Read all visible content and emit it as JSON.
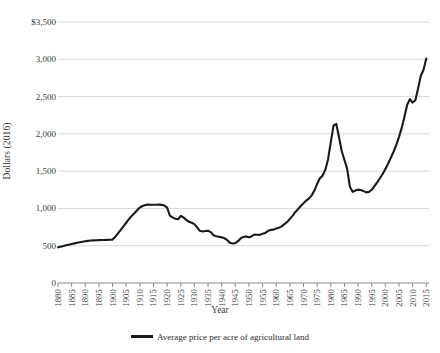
{
  "chart_data": {
    "type": "line",
    "title": "",
    "subtitle": "",
    "xlabel": "Year",
    "ylabel": "Dollars (2016)",
    "xlim": [
      1880,
      2016
    ],
    "ylim": [
      0,
      3500
    ],
    "grid": true,
    "legend_position": "bottom",
    "y_ticks": [
      0,
      500,
      1000,
      1500,
      2000,
      2500,
      3000,
      3500
    ],
    "y_tick_labels": [
      "0",
      "500",
      "1,000",
      "1,500",
      "2,000",
      "2,500",
      "3,000",
      "$3,500"
    ],
    "x_ticks": [
      1880,
      1885,
      1890,
      1895,
      1900,
      1905,
      1910,
      1915,
      1920,
      1925,
      1930,
      1935,
      1940,
      1945,
      1950,
      1955,
      1960,
      1965,
      1970,
      1975,
      1980,
      1985,
      1990,
      1995,
      2000,
      2005,
      2010,
      2015
    ],
    "x_tick_labels": [
      "1880",
      "1885",
      "1890",
      "1895",
      "1900",
      "1905",
      "1910",
      "1915",
      "1920",
      "1925",
      "1930",
      "1935",
      "1940",
      "1945",
      "1950",
      "1955",
      "1960",
      "1965",
      "1970",
      "1975",
      "1980",
      "1985",
      "1990",
      "1995",
      "2000",
      "2005",
      "2010",
      "2015"
    ],
    "line_color": "#1a1a1a",
    "grid_color": "#d9d9d9",
    "series": [
      {
        "name": "Average price per acre of agricultural land",
        "color": "#1a1a1a",
        "x": [
          1880,
          1881,
          1882,
          1883,
          1884,
          1885,
          1886,
          1887,
          1888,
          1889,
          1890,
          1891,
          1892,
          1893,
          1894,
          1895,
          1896,
          1897,
          1898,
          1899,
          1900,
          1901,
          1902,
          1903,
          1904,
          1905,
          1906,
          1907,
          1908,
          1909,
          1910,
          1911,
          1912,
          1913,
          1914,
          1915,
          1916,
          1917,
          1918,
          1919,
          1920,
          1921,
          1922,
          1923,
          1924,
          1925,
          1926,
          1927,
          1928,
          1929,
          1930,
          1931,
          1932,
          1933,
          1934,
          1935,
          1936,
          1937,
          1938,
          1939,
          1940,
          1941,
          1942,
          1943,
          1944,
          1945,
          1946,
          1947,
          1948,
          1949,
          1950,
          1951,
          1952,
          1953,
          1954,
          1955,
          1956,
          1957,
          1958,
          1959,
          1960,
          1961,
          1962,
          1963,
          1964,
          1965,
          1966,
          1967,
          1968,
          1969,
          1970,
          1971,
          1972,
          1973,
          1974,
          1975,
          1976,
          1977,
          1978,
          1979,
          1980,
          1981,
          1982,
          1983,
          1984,
          1985,
          1986,
          1987,
          1988,
          1989,
          1990,
          1991,
          1992,
          1993,
          1994,
          1995,
          1996,
          1997,
          1998,
          1999,
          2000,
          2001,
          2002,
          2003,
          2004,
          2005,
          2006,
          2007,
          2008,
          2009,
          2010,
          2011,
          2012,
          2013,
          2014,
          2015
        ],
        "values": [
          478,
          487,
          496,
          505,
          514,
          523,
          531,
          539,
          546,
          553,
          560,
          565,
          569,
          572,
          574,
          575,
          576,
          577,
          578,
          579,
          582,
          620,
          665,
          712,
          760,
          808,
          856,
          900,
          935,
          975,
          1012,
          1032,
          1046,
          1051,
          1050,
          1049,
          1050,
          1052,
          1048,
          1040,
          1010,
          905,
          880,
          862,
          855,
          900,
          880,
          845,
          820,
          808,
          790,
          745,
          700,
          690,
          697,
          700,
          682,
          640,
          628,
          620,
          612,
          600,
          578,
          540,
          530,
          535,
          560,
          600,
          618,
          625,
          612,
          628,
          650,
          648,
          645,
          660,
          672,
          700,
          712,
          716,
          730,
          742,
          760,
          790,
          818,
          860,
          900,
          952,
          990,
          1032,
          1070,
          1105,
          1135,
          1175,
          1240,
          1330,
          1405,
          1440,
          1520,
          1660,
          1890,
          2110,
          2135,
          1960,
          1770,
          1650,
          1530,
          1290,
          1222,
          1240,
          1252,
          1248,
          1232,
          1215,
          1222,
          1250,
          1300,
          1350,
          1405,
          1462,
          1530,
          1600,
          1680,
          1760,
          1850,
          1960,
          2080,
          2230,
          2390,
          2465,
          2420,
          2450,
          2610,
          2780,
          2860,
          3010
        ],
        "annotations": [
          {
            "label": "pre-1900 plateau",
            "x": 1895,
            "y": 575
          },
          {
            "label": "1910s farm boom peak",
            "x": 1913,
            "y": 1051
          },
          {
            "label": "Great Depression trough",
            "x": 1942,
            "y": 530
          },
          {
            "label": "1981 farm bubble peak",
            "x": 1981,
            "y": 2135
          },
          {
            "label": "1980s farm crisis low",
            "x": 1992,
            "y": 1215
          },
          {
            "label": "modern record high",
            "x": 2015,
            "y": 3010
          }
        ]
      }
    ]
  },
  "legend": {
    "entries": [
      {
        "label": "Average price per acre of agricultural land",
        "color": "#1a1a1a"
      }
    ]
  }
}
